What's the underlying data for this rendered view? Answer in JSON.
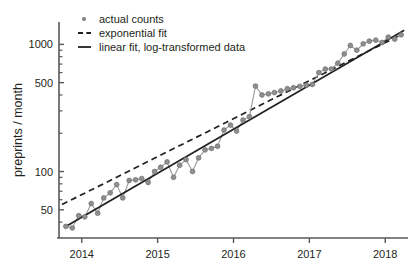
{
  "chart_data": {
    "type": "line",
    "title": "",
    "xlabel": "",
    "ylabel": "preprints / month",
    "yscale": "log",
    "ylim": [
      30,
      1500
    ],
    "xlim": [
      2013.7,
      2018.3
    ],
    "grid": false,
    "legend_position": "top-left",
    "x_ticks": [
      "2014",
      "2015",
      "2016",
      "2017",
      "2018"
    ],
    "x_tick_values": [
      2014,
      2015,
      2016,
      2017,
      2018
    ],
    "y_ticks": [
      "1000",
      "500",
      "100",
      "50"
    ],
    "y_tick_values": [
      1000,
      500,
      100,
      50
    ],
    "legend": [
      {
        "label": "actual counts",
        "marker": "dot",
        "color": "#808080"
      },
      {
        "label": "exponential fit",
        "marker": "dashed-line",
        "color": "#231f20"
      },
      {
        "label": "linear fit, log-transformed data",
        "marker": "solid-line",
        "color": "#231f20"
      }
    ],
    "series": [
      {
        "name": "actual counts",
        "type": "scatter-line",
        "x": [
          2013.79,
          2013.875,
          2013.96,
          2014.04,
          2014.125,
          2014.21,
          2014.29,
          2014.375,
          2014.46,
          2014.54,
          2014.625,
          2014.71,
          2014.79,
          2014.875,
          2014.96,
          2015.04,
          2015.125,
          2015.21,
          2015.29,
          2015.375,
          2015.46,
          2015.54,
          2015.625,
          2015.71,
          2015.79,
          2015.875,
          2015.96,
          2016.04,
          2016.125,
          2016.21,
          2016.29,
          2016.375,
          2016.46,
          2016.54,
          2016.625,
          2016.71,
          2016.79,
          2016.875,
          2016.96,
          2017.04,
          2017.125,
          2017.21,
          2017.29,
          2017.375,
          2017.46,
          2017.54,
          2017.625,
          2017.71,
          2017.79,
          2017.875,
          2017.96,
          2018.04,
          2018.125,
          2018.21
        ],
        "y": [
          37,
          36,
          45,
          44,
          56,
          47,
          62,
          68,
          79,
          62,
          85,
          86,
          88,
          82,
          100,
          108,
          119,
          90,
          112,
          124,
          100,
          128,
          148,
          152,
          158,
          212,
          232,
          208,
          254,
          270,
          470,
          400,
          408,
          418,
          430,
          448,
          456,
          468,
          478,
          484,
          600,
          640,
          640,
          712,
          840,
          980,
          900,
          1010,
          1060,
          1080,
          1035,
          1140,
          1100,
          1190
        ]
      },
      {
        "name": "exponential fit",
        "type": "line",
        "style": "dashed",
        "x": [
          2013.74,
          2018.22
        ],
        "y": [
          55,
          1200
        ]
      },
      {
        "name": "linear fit, log-transformed data",
        "type": "line",
        "style": "solid",
        "x": [
          2013.79,
          2018.25
        ],
        "y": [
          37,
          1290
        ]
      }
    ]
  }
}
